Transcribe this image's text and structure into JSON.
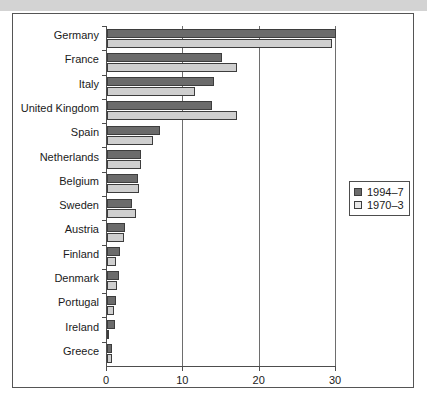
{
  "chart_data": {
    "type": "bar",
    "orientation": "horizontal",
    "title": "",
    "subtitle": "",
    "xlabel": "",
    "ylabel": "",
    "xlim": [
      0,
      30
    ],
    "xticks": [
      0,
      10,
      20,
      30
    ],
    "xtick_labels": [
      "0",
      "10",
      "20",
      "30"
    ],
    "grid": true,
    "grid_axis": "x",
    "legend_position": "right",
    "categories": [
      "Germany",
      "France",
      "Italy",
      "United Kingdom",
      "Spain",
      "Netherlands",
      "Belgium",
      "Sweden",
      "Austria",
      "Finland",
      "Denmark",
      "Portugal",
      "Ireland",
      "Greece"
    ],
    "series": [
      {
        "name": "1994–7",
        "color": "#6b6b6b",
        "values": [
          30.0,
          15.0,
          14.0,
          13.8,
          7.0,
          4.5,
          4.0,
          3.3,
          2.3,
          1.7,
          1.6,
          1.2,
          1.0,
          0.7
        ]
      },
      {
        "name": "1970–3",
        "color": "#cfcfcf",
        "values": [
          29.5,
          17.0,
          11.5,
          17.0,
          6.0,
          4.5,
          4.2,
          3.8,
          2.2,
          1.2,
          1.3,
          0.9,
          0.3,
          0.6
        ]
      }
    ]
  },
  "legend": {
    "items": [
      {
        "label": "1994–7",
        "swatch": "recent"
      },
      {
        "label": "1970–3",
        "swatch": "older"
      }
    ]
  }
}
